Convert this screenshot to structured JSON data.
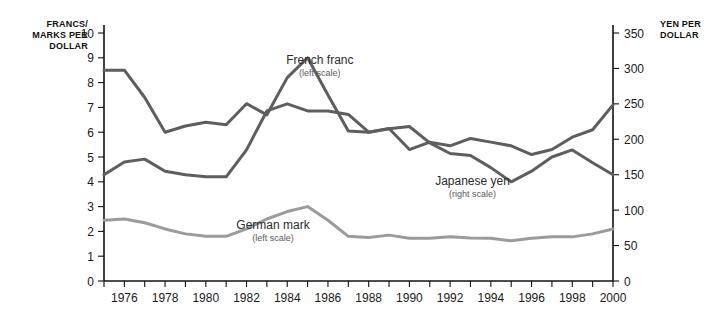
{
  "chart_data": {
    "type": "line",
    "title": "",
    "xlabel": "",
    "ylabel": "FRANCS/ MARKS PER DOLLAR",
    "y2label": "YEN PER DOLLAR",
    "grid": false,
    "legend_position": "inline-annotations",
    "x": [
      1975,
      1976,
      1977,
      1978,
      1979,
      1980,
      1981,
      1982,
      1983,
      1984,
      1985,
      1986,
      1987,
      1988,
      1989,
      1990,
      1991,
      1992,
      1993,
      1994,
      1995,
      1996,
      1997,
      1998,
      1999,
      2000
    ],
    "xlim": [
      1975,
      2000
    ],
    "xticks": [
      1975,
      1976,
      1977,
      1978,
      1979,
      1980,
      1981,
      1982,
      1983,
      1984,
      1985,
      1986,
      1987,
      1988,
      1989,
      1990,
      1991,
      1992,
      1993,
      1994,
      1995,
      1996,
      1997,
      1998,
      1999,
      2000
    ],
    "xtick_labels": [
      "1976",
      "1978",
      "1980",
      "1982",
      "1984",
      "1986",
      "1988",
      "1990",
      "1992",
      "1994",
      "1996",
      "1998",
      "2000"
    ],
    "xtick_label_years": [
      1976,
      1978,
      1980,
      1982,
      1984,
      1986,
      1988,
      1990,
      1992,
      1994,
      1996,
      1998,
      2000
    ],
    "ylim": [
      0,
      10
    ],
    "yticks": [
      0,
      1,
      2,
      3,
      4,
      5,
      6,
      7,
      8,
      9,
      10
    ],
    "ytick_labels": [
      "0",
      "1",
      "2",
      "3",
      "4",
      "5",
      "6",
      "7",
      "8",
      "9",
      "10"
    ],
    "y2lim": [
      0,
      350
    ],
    "y2ticks": [
      0,
      50,
      100,
      150,
      200,
      250,
      300,
      350
    ],
    "y2tick_labels": [
      "0",
      "50",
      "100",
      "150",
      "200",
      "250",
      "300",
      "350"
    ],
    "series": [
      {
        "name": "French franc",
        "sublabel": "(left scale)",
        "axis": "left",
        "color": "#5e5e5e",
        "width": 3,
        "label_x": 1985.6,
        "label_y": 8.75,
        "values": [
          8.5,
          8.5,
          7.4,
          6.0,
          6.25,
          6.4,
          6.3,
          7.15,
          6.7,
          8.2,
          9.0,
          7.5,
          6.05,
          6.0,
          6.15,
          5.3,
          5.6,
          5.45,
          5.75,
          5.6,
          5.45,
          5.1,
          5.3,
          5.8,
          6.1,
          7.1
        ]
      },
      {
        "name": "Japanese yen",
        "sublabel": "(right scale)",
        "axis": "right",
        "color": "#5e5e5e",
        "width": 3,
        "label_x": 1993.1,
        "label_y_right": 135,
        "values": [
          150,
          168,
          172,
          155,
          150,
          147,
          147,
          185,
          240,
          250,
          240,
          240,
          235,
          210,
          215,
          218,
          195,
          180,
          177,
          160,
          140,
          155,
          175,
          185,
          167,
          150
        ]
      },
      {
        "name": "German mark",
        "sublabel": "(left scale)",
        "axis": "left",
        "color": "#9b9b9b",
        "width": 3,
        "label_x": 1983.3,
        "label_y": 2.1,
        "values": [
          2.45,
          2.5,
          2.35,
          2.1,
          1.9,
          1.8,
          1.8,
          2.1,
          2.5,
          2.8,
          3.0,
          2.45,
          1.8,
          1.75,
          1.85,
          1.72,
          1.72,
          1.78,
          1.73,
          1.72,
          1.62,
          1.72,
          1.78,
          1.78,
          1.9,
          2.1
        ]
      }
    ]
  }
}
